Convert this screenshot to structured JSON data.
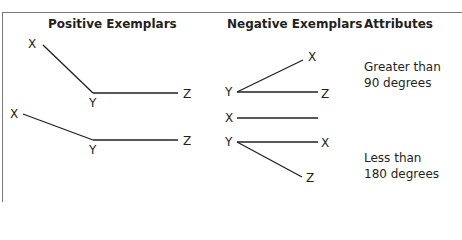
{
  "caption": "Figure: Concept Exemplars",
  "headers": {
    "positive": "Positive Exemplars",
    "negative": "Negative Exemplars",
    "attributes": "Attributes"
  },
  "positive_exemplars": [
    {
      "x_label": "X",
      "y_label": "Y",
      "z_label": "Z"
    },
    {
      "x_label": "X",
      "y_label": "Y",
      "z_label": "Z"
    }
  ],
  "negative_exemplars": [
    {
      "y_label": "Y",
      "x_label": "X",
      "z_label": "Z"
    },
    {
      "x_label": "X"
    },
    {
      "y_label": "Y",
      "x_label": "X",
      "z_label": "Z"
    }
  ],
  "attributes": [
    {
      "line1": "Greater than",
      "line2": "90 degrees"
    },
    {
      "line1": "Less than",
      "line2": "180 degrees"
    }
  ],
  "colors": {
    "line": "#231f20",
    "border": "#7a7a7a",
    "background": "#ffffff"
  }
}
